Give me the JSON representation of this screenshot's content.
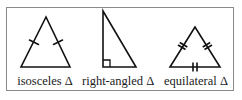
{
  "figure": {
    "stroke_color": "#111111",
    "frame_color": "#8a8a8a",
    "triangles": [
      {
        "name": "isosceles",
        "label": "isosceles Δ",
        "markings": "single tick on each of the two equal sides"
      },
      {
        "name": "right-angled",
        "label": "right-angled Δ",
        "markings": "right-angle square at bottom-left corner"
      },
      {
        "name": "equilateral",
        "label": "equilateral Δ",
        "markings": "double tick on all three sides"
      }
    ]
  }
}
